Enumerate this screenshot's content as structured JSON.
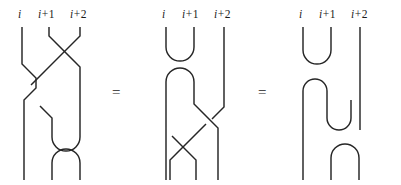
{
  "figure": {
    "kind": "knot-diagram-identity",
    "background_color": "#ffffff",
    "stroke_color": "#262626",
    "equals_1": "=",
    "equals_2": "="
  },
  "labels": {
    "i": "i",
    "i_plus_1_var": "i",
    "i_plus_1_op": "+",
    "i_plus_1_num": "1",
    "i_plus_2_var": "i",
    "i_plus_2_op": "+",
    "i_plus_2_num": "2"
  },
  "diagrams": [
    {
      "name": "left-diagram",
      "strand_count": 3,
      "features": [
        "crossing",
        "cup",
        "cap"
      ]
    },
    {
      "name": "middle-diagram",
      "strand_count": 3,
      "features": [
        "cup",
        "cap",
        "crossing",
        "crossing"
      ]
    },
    {
      "name": "right-diagram",
      "strand_count": 3,
      "features": [
        "cup",
        "cap",
        "cup",
        "cap"
      ]
    }
  ]
}
